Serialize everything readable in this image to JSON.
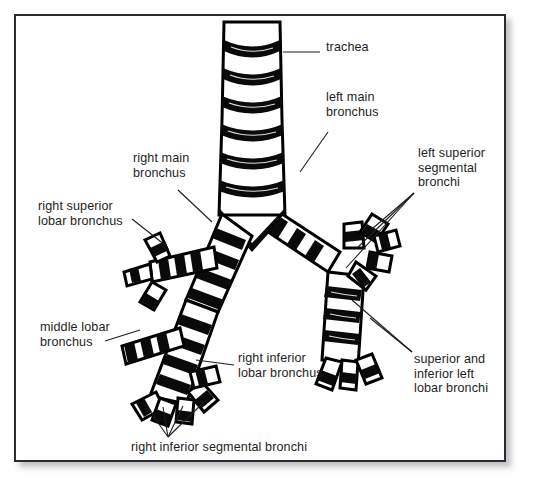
{
  "figure": {
    "background_color": "#ffffff",
    "frame_color": "#2b2b2f",
    "ink_color": "#000000",
    "label_color": "#1e1e22"
  },
  "labels": [
    {
      "id": "trachea",
      "text": "trachea",
      "x": 326,
      "y": 46,
      "align": "left"
    },
    {
      "id": "left-main-bronchus",
      "text": "left main\nbronchus",
      "x": 326,
      "y": 96,
      "align": "left"
    },
    {
      "id": "left-superior-segmental",
      "text": "left superior\nsegmental\nbronchi",
      "x": 418,
      "y": 152,
      "align": "left"
    },
    {
      "id": "right-main-bronchus",
      "text": "right main\nbronchus",
      "x": 133,
      "y": 157,
      "align": "left"
    },
    {
      "id": "right-superior-lobar",
      "text": "right superior\nlobar bronchus",
      "x": 38,
      "y": 205,
      "align": "left"
    },
    {
      "id": "middle-lobar-bronchus",
      "text": "middle lobar\nbronchus",
      "x": 40,
      "y": 326,
      "align": "left"
    },
    {
      "id": "right-inferior-lobar",
      "text": "right inferior\nlobar bronchus",
      "x": 238,
      "y": 357,
      "align": "left"
    },
    {
      "id": "superior-inferior-left-lobar",
      "text": "superior and\ninferior left\nlobar bronchi",
      "x": 414,
      "y": 358,
      "align": "left"
    },
    {
      "id": "right-inferior-segmental",
      "text": "right inferior segmental bronchi",
      "x": 131,
      "y": 446,
      "align": "left"
    }
  ],
  "leader_lines": [
    {
      "id": "leader-trachea",
      "points": "283,52 320,52"
    },
    {
      "id": "leader-left-main",
      "points": "328,132 300,172"
    },
    {
      "id": "leader-left-sup-seg-a",
      "points": "414,193 372,229"
    },
    {
      "id": "leader-left-sup-seg-b",
      "points": "414,193 357,248"
    },
    {
      "id": "leader-left-sup-seg-c",
      "points": "414,193 346,268"
    },
    {
      "id": "leader-right-main",
      "points": "178,190 212,222"
    },
    {
      "id": "leader-right-sup-lobar",
      "points": "132,219 165,245"
    },
    {
      "id": "leader-middle-lobar",
      "points": "105,341 140,330"
    },
    {
      "id": "leader-right-inf-lobar",
      "points": "234,365 196,360"
    },
    {
      "id": "leader-sup-inf-left-a",
      "points": "412,352 370,318"
    },
    {
      "id": "leader-sup-inf-left-b",
      "points": "412,352 352,300"
    },
    {
      "id": "leader-right-inf-seg-a",
      "points": "168,437 145,404"
    },
    {
      "id": "leader-right-inf-seg-b",
      "points": "168,437 163,407"
    },
    {
      "id": "leader-right-inf-seg-c",
      "points": "168,437 183,406"
    },
    {
      "id": "leader-right-inf-seg-d",
      "points": "168,437 204,402"
    }
  ],
  "airways": {
    "trachea": {
      "top_y": 22,
      "bottom_y": 215,
      "top_half_width": 28,
      "bottom_half_width": 33,
      "center_x": 252
    },
    "carina_y": 228,
    "right_main": {
      "from": [
        236,
        222
      ],
      "to": [
        196,
        300
      ]
    },
    "left_main": {
      "from": [
        272,
        222
      ],
      "to": [
        330,
        268
      ]
    }
  }
}
